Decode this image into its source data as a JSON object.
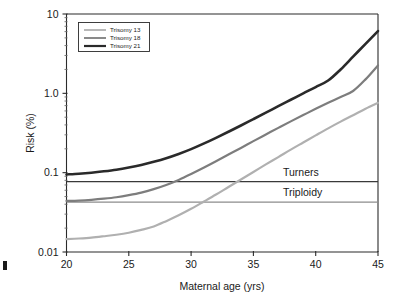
{
  "chart_data": {
    "type": "line",
    "title": "",
    "xlabel": "Maternal age (yrs)",
    "ylabel": "Risk (%)",
    "xlim": [
      20,
      45
    ],
    "ylim": [
      0.01,
      10
    ],
    "yscale": "log",
    "xscale": "linear",
    "grid": false,
    "legend_position": "top-left",
    "x_ticks": [
      "20",
      "25",
      "30",
      "35",
      "40",
      "45"
    ],
    "x_tick_values": [
      20,
      25,
      30,
      35,
      40,
      45
    ],
    "y_ticks": [
      "0.01",
      "0.1",
      "1.0",
      "10"
    ],
    "y_tick_values": [
      0.01,
      0.1,
      1.0,
      10
    ],
    "x": [
      20,
      21,
      22,
      23,
      24,
      25,
      26,
      27,
      28,
      29,
      30,
      31,
      32,
      33,
      34,
      35,
      36,
      37,
      38,
      39,
      40,
      41,
      42,
      43,
      44,
      45
    ],
    "series": [
      {
        "name": "Trisomy 13",
        "color": "#b0b0b0",
        "width": 2.2,
        "values": [
          0.0145,
          0.0148,
          0.0152,
          0.0158,
          0.0165,
          0.0175,
          0.019,
          0.021,
          0.0245,
          0.029,
          0.035,
          0.043,
          0.053,
          0.066,
          0.082,
          0.102,
          0.127,
          0.157,
          0.195,
          0.24,
          0.295,
          0.362,
          0.44,
          0.53,
          0.64,
          0.76
        ]
      },
      {
        "name": "Trisomy 18",
        "color": "#7d7d7d",
        "width": 2.2,
        "values": [
          0.044,
          0.0445,
          0.0455,
          0.047,
          0.049,
          0.052,
          0.056,
          0.062,
          0.07,
          0.081,
          0.096,
          0.115,
          0.139,
          0.169,
          0.205,
          0.25,
          0.303,
          0.367,
          0.443,
          0.532,
          0.638,
          0.76,
          0.9,
          1.07,
          1.5,
          2.25
        ]
      },
      {
        "name": "Trisomy 21",
        "color": "#2a2a2a",
        "width": 2.6,
        "values": [
          0.095,
          0.097,
          0.1,
          0.104,
          0.109,
          0.116,
          0.125,
          0.137,
          0.152,
          0.172,
          0.198,
          0.232,
          0.275,
          0.328,
          0.393,
          0.473,
          0.57,
          0.69,
          0.83,
          1.0,
          1.2,
          1.45,
          2.0,
          2.9,
          4.2,
          6.1
        ]
      }
    ],
    "reference_lines": [
      {
        "label": "Turners",
        "value": 0.077,
        "color": "#3a3a3a"
      },
      {
        "label": "Triploidy",
        "value": 0.0425,
        "color": "#8c8c8c"
      }
    ]
  },
  "legend": {
    "items": [
      {
        "label": "Trisomy 13"
      },
      {
        "label": "Trisomy 18"
      },
      {
        "label": "Trisomy 21"
      }
    ]
  },
  "axes": {
    "y_title": "Risk (%)",
    "x_title": "Maternal age (yrs)"
  }
}
